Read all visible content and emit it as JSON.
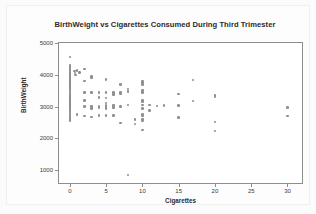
{
  "chart_data": {
    "type": "scatter",
    "title": "BirthWeight vs Cigarettes Consumed During Third Trimester",
    "xlabel": "Cigarettes",
    "ylabel": "BirthWeight",
    "xlim": [
      -1.5,
      32
    ],
    "ylim": [
      600,
      5000
    ],
    "xticks": [
      0,
      5,
      10,
      15,
      20,
      25,
      30
    ],
    "xtick_labels": [
      "0",
      "5",
      "10",
      "15",
      "20",
      "25",
      "30"
    ],
    "yticks": [
      1000,
      2000,
      3000,
      4000,
      5000
    ],
    "ytick_labels": [
      "1000",
      "2000",
      "3000",
      "4000",
      "5000"
    ],
    "grid": false,
    "legend": null,
    "marker": {
      "shape": "circle",
      "color": "#8e8e8e",
      "size": 2.6
    },
    "frame_color": "#8d8d8d",
    "background_color": "#ffffff",
    "figure_background_color": "#fbfbfb",
    "title_color": "#2b2b2b",
    "points": [
      [
        0,
        4560
      ],
      [
        0,
        4290
      ],
      [
        0,
        4230
      ],
      [
        0,
        4160
      ],
      [
        0,
        4120
      ],
      [
        0,
        4080
      ],
      [
        0,
        4050
      ],
      [
        0,
        4020
      ],
      [
        0,
        3980
      ],
      [
        0,
        3950
      ],
      [
        0,
        3920
      ],
      [
        0,
        3880
      ],
      [
        0,
        3850
      ],
      [
        0,
        3820
      ],
      [
        0,
        3790
      ],
      [
        0,
        3760
      ],
      [
        0,
        3730
      ],
      [
        0,
        3700
      ],
      [
        0,
        3670
      ],
      [
        0,
        3640
      ],
      [
        0,
        3610
      ],
      [
        0,
        3580
      ],
      [
        0,
        3550
      ],
      [
        0,
        3520
      ],
      [
        0,
        3490
      ],
      [
        0,
        3460
      ],
      [
        0,
        3430
      ],
      [
        0,
        3400
      ],
      [
        0,
        3370
      ],
      [
        0,
        3340
      ],
      [
        0,
        3310
      ],
      [
        0,
        3280
      ],
      [
        0,
        3250
      ],
      [
        0,
        3220
      ],
      [
        0,
        3190
      ],
      [
        0,
        3160
      ],
      [
        0,
        3130
      ],
      [
        0,
        3100
      ],
      [
        0,
        3070
      ],
      [
        0,
        3040
      ],
      [
        0,
        3010
      ],
      [
        0,
        2980
      ],
      [
        0,
        2950
      ],
      [
        0,
        2920
      ],
      [
        0,
        2890
      ],
      [
        0,
        2860
      ],
      [
        0,
        2830
      ],
      [
        0,
        2800
      ],
      [
        0,
        2770
      ],
      [
        0,
        2740
      ],
      [
        0,
        2700
      ],
      [
        0,
        2650
      ],
      [
        0,
        2600
      ],
      [
        0,
        2560
      ],
      [
        0.6,
        4120
      ],
      [
        0.7,
        4060
      ],
      [
        0.8,
        3990
      ],
      [
        1,
        4130
      ],
      [
        1,
        2760
      ],
      [
        1.3,
        4080
      ],
      [
        2,
        4180
      ],
      [
        2,
        3800
      ],
      [
        2,
        3450
      ],
      [
        2,
        3200
      ],
      [
        2,
        3010
      ],
      [
        2,
        2700
      ],
      [
        3,
        3950
      ],
      [
        3,
        3900
      ],
      [
        3,
        3450
      ],
      [
        3,
        3000
      ],
      [
        3,
        2950
      ],
      [
        3,
        2680
      ],
      [
        4,
        3450
      ],
      [
        4,
        3290
      ],
      [
        4,
        3020
      ],
      [
        4,
        2980
      ],
      [
        4,
        2730
      ],
      [
        5,
        3860
      ],
      [
        5,
        3450
      ],
      [
        5,
        3270
      ],
      [
        5,
        3120
      ],
      [
        5,
        3050
      ],
      [
        5,
        3000
      ],
      [
        5,
        2950
      ],
      [
        5,
        2720
      ],
      [
        6,
        3450
      ],
      [
        6,
        3380
      ],
      [
        6,
        3050
      ],
      [
        6,
        3000
      ],
      [
        6,
        2960
      ],
      [
        6,
        2720
      ],
      [
        7,
        3700
      ],
      [
        7,
        3450
      ],
      [
        7,
        3400
      ],
      [
        7,
        3000
      ],
      [
        7,
        2490
      ],
      [
        8,
        3550
      ],
      [
        8,
        3470
      ],
      [
        8,
        3050
      ],
      [
        8,
        850
      ],
      [
        9,
        2600
      ],
      [
        9,
        2460
      ],
      [
        10,
        3800
      ],
      [
        10,
        3750
      ],
      [
        10,
        3700
      ],
      [
        10,
        3500
      ],
      [
        10,
        3450
      ],
      [
        10,
        3200
      ],
      [
        10,
        3150
      ],
      [
        10,
        3050
      ],
      [
        10,
        2950
      ],
      [
        10,
        2750
      ],
      [
        10,
        2700
      ],
      [
        10,
        2600
      ],
      [
        10,
        2550
      ],
      [
        10,
        2260
      ],
      [
        11,
        3050
      ],
      [
        11,
        2880
      ],
      [
        12,
        3020
      ],
      [
        13,
        3030
      ],
      [
        15,
        3400
      ],
      [
        15,
        3030
      ],
      [
        15,
        2660
      ],
      [
        17,
        3840
      ],
      [
        17,
        3180
      ],
      [
        20,
        3350
      ],
      [
        20,
        3300
      ],
      [
        20,
        2520
      ],
      [
        20,
        2240
      ],
      [
        30,
        2980
      ],
      [
        30,
        2700
      ]
    ]
  }
}
